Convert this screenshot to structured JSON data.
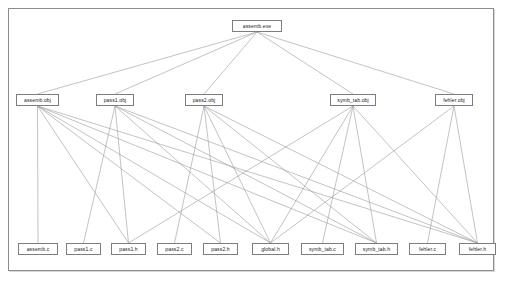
{
  "diagram": {
    "type": "dependency-tree",
    "background_color": "#ffffff",
    "border_color": "#8c8c8c",
    "node_border_color": "#7d7d7d",
    "edge_color": "#9a9a9a",
    "nodes": [
      {
        "id": "assemb_exe",
        "label": "assemb.exe",
        "x": 232,
        "y": 20,
        "w": 50,
        "level": 0
      },
      {
        "id": "assemb_obj",
        "label": "assemb.obj",
        "x": 16,
        "y": 94,
        "w": 43,
        "level": 1
      },
      {
        "id": "pass1_obj",
        "label": "pass1.obj",
        "x": 96,
        "y": 94,
        "w": 38,
        "level": 1
      },
      {
        "id": "pass2_obj",
        "label": "pass2.obj",
        "x": 185,
        "y": 94,
        "w": 38,
        "level": 1
      },
      {
        "id": "symb_tab_obj",
        "label": "symb_tab.obj",
        "x": 330,
        "y": 94,
        "w": 46,
        "level": 1
      },
      {
        "id": "fehler_obj",
        "label": "fehler.obj",
        "x": 435,
        "y": 94,
        "w": 38,
        "level": 1
      },
      {
        "id": "assemb_c",
        "label": "assemb.c",
        "x": 18,
        "y": 243,
        "w": 40,
        "level": 2
      },
      {
        "id": "pass1_c",
        "label": "pass1.c",
        "x": 66,
        "y": 243,
        "w": 35,
        "level": 2
      },
      {
        "id": "pass1_h",
        "label": "pass1.h",
        "x": 111,
        "y": 243,
        "w": 35,
        "level": 2
      },
      {
        "id": "pass2_c",
        "label": "pass2.c",
        "x": 157,
        "y": 243,
        "w": 35,
        "level": 2
      },
      {
        "id": "pass2_h",
        "label": "pass2.h",
        "x": 203,
        "y": 243,
        "w": 35,
        "level": 2
      },
      {
        "id": "global_h",
        "label": "global.h",
        "x": 252,
        "y": 243,
        "w": 37,
        "level": 2
      },
      {
        "id": "symb_tab_c",
        "label": "symb_tab.c",
        "x": 301,
        "y": 243,
        "w": 43,
        "level": 2
      },
      {
        "id": "symb_tab_h",
        "label": "symb_tab.h",
        "x": 355,
        "y": 243,
        "w": 43,
        "level": 2
      },
      {
        "id": "fehler_c",
        "label": "fehler.c",
        "x": 409,
        "y": 243,
        "w": 37,
        "level": 2
      },
      {
        "id": "fehler_h",
        "label": "fehler.h",
        "x": 459,
        "y": 243,
        "w": 37,
        "level": 2
      }
    ],
    "edges": [
      {
        "from": "assemb_exe",
        "to": "assemb_obj"
      },
      {
        "from": "assemb_exe",
        "to": "pass1_obj"
      },
      {
        "from": "assemb_exe",
        "to": "pass2_obj"
      },
      {
        "from": "assemb_exe",
        "to": "symb_tab_obj"
      },
      {
        "from": "assemb_exe",
        "to": "fehler_obj"
      },
      {
        "from": "assemb_obj",
        "to": "assemb_c"
      },
      {
        "from": "assemb_obj",
        "to": "pass1_h"
      },
      {
        "from": "assemb_obj",
        "to": "pass2_h"
      },
      {
        "from": "assemb_obj",
        "to": "global_h"
      },
      {
        "from": "assemb_obj",
        "to": "symb_tab_h"
      },
      {
        "from": "assemb_obj",
        "to": "fehler_h"
      },
      {
        "from": "pass1_obj",
        "to": "pass1_c"
      },
      {
        "from": "pass1_obj",
        "to": "pass1_h"
      },
      {
        "from": "pass1_obj",
        "to": "global_h"
      },
      {
        "from": "pass1_obj",
        "to": "symb_tab_h"
      },
      {
        "from": "pass1_obj",
        "to": "fehler_h"
      },
      {
        "from": "pass2_obj",
        "to": "pass2_c"
      },
      {
        "from": "pass2_obj",
        "to": "pass2_h"
      },
      {
        "from": "pass2_obj",
        "to": "global_h"
      },
      {
        "from": "pass2_obj",
        "to": "symb_tab_h"
      },
      {
        "from": "pass2_obj",
        "to": "fehler_h"
      },
      {
        "from": "symb_tab_obj",
        "to": "pass1_h"
      },
      {
        "from": "symb_tab_obj",
        "to": "global_h"
      },
      {
        "from": "symb_tab_obj",
        "to": "symb_tab_c"
      },
      {
        "from": "symb_tab_obj",
        "to": "symb_tab_h"
      },
      {
        "from": "symb_tab_obj",
        "to": "fehler_h"
      },
      {
        "from": "fehler_obj",
        "to": "global_h"
      },
      {
        "from": "fehler_obj",
        "to": "fehler_c"
      },
      {
        "from": "fehler_obj",
        "to": "fehler_h"
      }
    ]
  }
}
